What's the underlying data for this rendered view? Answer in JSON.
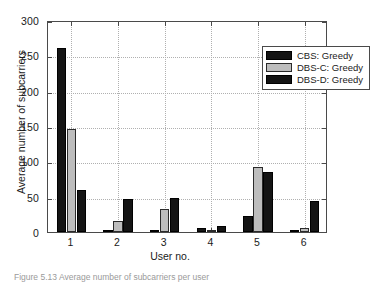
{
  "chart_data": {
    "type": "bar",
    "title": "",
    "xlabel": "User no.",
    "ylabel": "Average number of subcarriers",
    "categories": [
      "1",
      "2",
      "3",
      "4",
      "5",
      "6"
    ],
    "series": [
      {
        "name": "CBS: Greedy",
        "color": "#141414",
        "values": [
          261,
          2,
          3,
          5,
          23,
          1
        ]
      },
      {
        "name": "DBS-C: Greedy",
        "color": "#bdbdbd",
        "values": [
          146,
          15,
          33,
          2,
          92,
          5
        ]
      },
      {
        "name": "DBS-D: Greedy",
        "color": "#141414",
        "values": [
          60,
          47,
          48,
          9,
          85,
          44
        ]
      }
    ],
    "ylim": [
      0,
      300
    ],
    "yticks": [
      0,
      50,
      100,
      150,
      200,
      250,
      300
    ],
    "yticklabels": [
      "0",
      "50",
      "100",
      "150",
      "200",
      "250",
      "300"
    ],
    "xticklabels": [
      "1",
      "2",
      "3",
      "4",
      "5",
      "6"
    ],
    "grid": true,
    "legend_position": "upper right"
  },
  "legend": {
    "items": [
      {
        "label": "CBS: Greedy"
      },
      {
        "label": "DBS-C: Greedy"
      },
      {
        "label": "DBS-D: Greedy"
      }
    ]
  },
  "caption": {
    "text": "Figure 5.13  Average number of subcarriers per user"
  }
}
